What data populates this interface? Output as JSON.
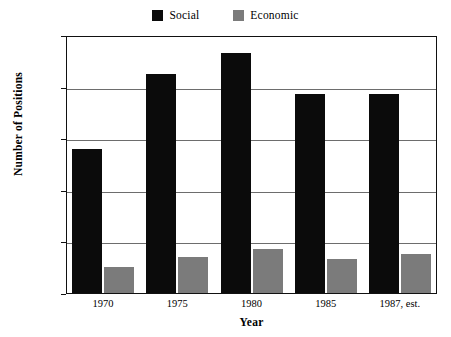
{
  "chart_data": {
    "type": "bar",
    "title": "",
    "xlabel": "Year",
    "ylabel": "Number of Positions",
    "categories": [
      "1970",
      "1975",
      "1980",
      "1985",
      "1987, est."
    ],
    "series": [
      {
        "name": "Social",
        "color": "#0b0b0b",
        "values": [
          66000,
          95000,
          103000,
          87000,
          87000
        ]
      },
      {
        "name": "Economic",
        "color": "#7b7b7b",
        "values": [
          20000,
          24000,
          27000,
          23000,
          25000
        ]
      }
    ],
    "ylim": [
      10000,
      110000
    ],
    "ytick_labels": [
      "110,000",
      "90,000",
      "70,000",
      "50,000",
      "30,000",
      "10,000"
    ],
    "ytick_values": [
      110000,
      90000,
      70000,
      50000,
      30000,
      10000
    ],
    "grid": true,
    "legend_position": "top-center"
  },
  "legend": {
    "entries": [
      {
        "label": "Social",
        "swatch": "black-square-swatch"
      },
      {
        "label": "Economic",
        "swatch": "gray-square-swatch"
      }
    ]
  },
  "axes": {
    "y_title": "Number of Positions",
    "x_title": "Year"
  }
}
